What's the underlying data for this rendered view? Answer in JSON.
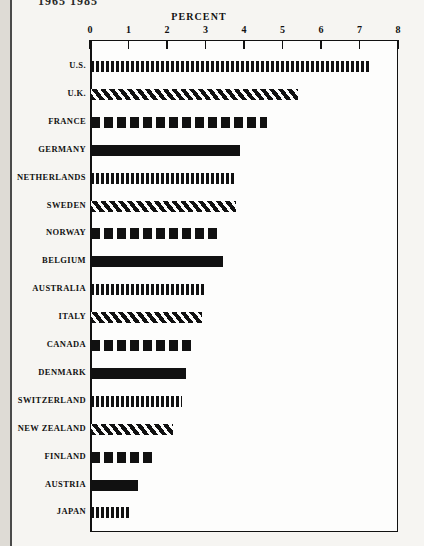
{
  "running_head": "1965   1985",
  "frame": {
    "left_px": 90,
    "top_px": 40,
    "width_px": 308,
    "height_px": 492
  },
  "chart_data": {
    "type": "bar",
    "orientation": "horizontal",
    "title": "PERCENT",
    "xlabel": "PERCENT",
    "ylabel": "",
    "xlim": [
      0,
      8
    ],
    "grid": false,
    "legend": "none",
    "tick_labels": [
      "0",
      "1",
      "2",
      "3",
      "4",
      "5",
      "6",
      "7",
      "8"
    ],
    "ticks": [
      0,
      1,
      2,
      3,
      4,
      5,
      6,
      7,
      8
    ],
    "categories": [
      "U.S.",
      "U.K.",
      "FRANCE",
      "GERMANY",
      "NETHERLANDS",
      "SWEDEN",
      "NORWAY",
      "BELGIUM",
      "AUSTRALIA",
      "ITALY",
      "CANADA",
      "DENMARK",
      "SWITZERLAND",
      "NEW ZEALAND",
      "FINLAND",
      "AUSTRIA",
      "JAPAN"
    ],
    "values": [
      7.3,
      5.4,
      4.6,
      3.9,
      3.75,
      3.8,
      3.3,
      3.45,
      3.0,
      2.9,
      2.7,
      2.5,
      2.4,
      2.15,
      1.65,
      1.25,
      1.0
    ],
    "patterns": [
      "vertical-stripe",
      "diagonal-hatch",
      "coarse-dash",
      "solid",
      "vertical-stripe",
      "diagonal-hatch",
      "coarse-dash",
      "solid",
      "vertical-stripe",
      "diagonal-hatch",
      "coarse-dash",
      "solid",
      "vertical-stripe",
      "diagonal-hatch",
      "coarse-dash",
      "solid",
      "vertical-stripe"
    ],
    "colors": {
      "ink": "#111111",
      "paper": "#fdfdfc"
    }
  }
}
